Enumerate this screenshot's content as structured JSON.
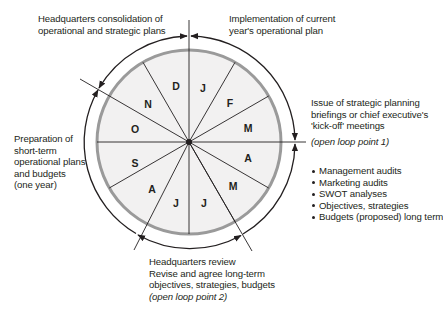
{
  "diagram": {
    "type": "annual planning cycle wheel",
    "colors": {
      "wheel_fill": "#f2f1f1",
      "wheel_ring": "#9a9a9a",
      "lines": "#231f20",
      "text": "#231f20"
    },
    "months": [
      "J",
      "F",
      "M",
      "A",
      "M",
      "J",
      "J",
      "A",
      "S",
      "O",
      "N",
      "D"
    ],
    "annotations": {
      "top_left": [
        "Headquarters consolidation of",
        "operational and strategic plans"
      ],
      "top_right": [
        "Implementation of current",
        "year's operational plan"
      ],
      "right": [
        "Issue of strategic planning",
        "briefings or chief executive's",
        "'kick-off' meetings"
      ],
      "right_loop": "(open loop point 1)",
      "right_bullets": [
        "Management audits",
        "Marketing audits",
        "SWOT analyses",
        "Objectives, strategies",
        "Budgets (proposed) long term"
      ],
      "left": [
        "Preparation of",
        "short-term",
        "operational plans",
        "and budgets",
        "(one year)"
      ],
      "bottom": [
        "Headquarters review",
        "Revise and agree long-term",
        "objectives, strategies, budgets"
      ],
      "bottom_loop": "(open loop point 2)"
    }
  }
}
